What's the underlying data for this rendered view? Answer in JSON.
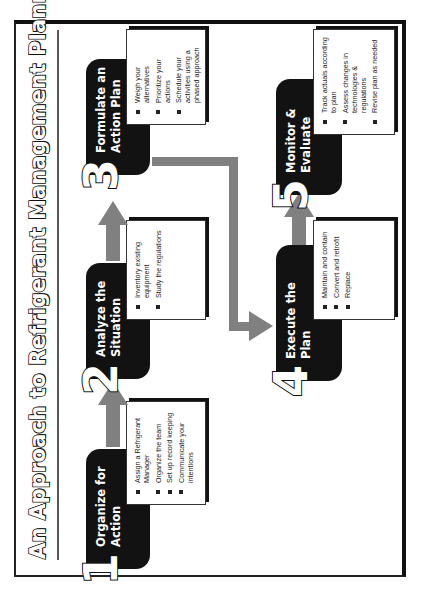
{
  "title": "An Approach to Refrigerant Management Planning",
  "orientation": "rotated 90 degrees counter-clockwise",
  "colors": {
    "step_box": "#121212",
    "arrow": "#808080",
    "frame": "#222222",
    "background": "#ffffff"
  },
  "steps": [
    {
      "number": "1",
      "title": "Organize for\nAction",
      "bullets": [
        "Assign a Refrigerant Manager",
        "Organize the team",
        "Set up record keeping",
        "Communicate your intentions"
      ]
    },
    {
      "number": "2",
      "title": "Analyze the\nSituation",
      "bullets": [
        "Inventory existing equipment",
        "Study the regulations"
      ]
    },
    {
      "number": "3",
      "title": "Formulate an\nAction Plan",
      "bullets": [
        "Weigh your alternatives",
        "Prioritize your actions",
        "Schedule your activities using a phased approach"
      ]
    },
    {
      "number": "4",
      "title": "Execute the\nPlan",
      "bullets": [
        "Maintain and contain",
        "Convert and retrofit",
        "Replace"
      ]
    },
    {
      "number": "5",
      "title": "Monitor &\nEvaluate",
      "bullets": [
        "Track actuals according to plan",
        "Assess changes in technologies & regulations",
        "Revise plan as needed"
      ]
    }
  ],
  "flow": [
    "1 -> 2",
    "2 -> 3",
    "3 -> 4",
    "4 -> 5"
  ]
}
